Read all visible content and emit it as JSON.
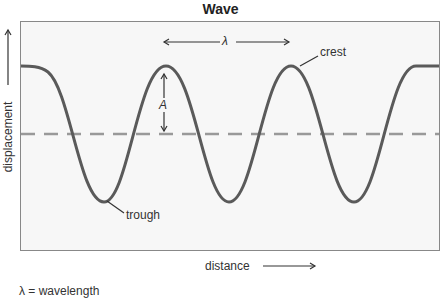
{
  "title": "Wave",
  "labels": {
    "wavelength_symbol": "λ",
    "amplitude_symbol": "A",
    "crest": "crest",
    "trough": "trough",
    "x_axis": "distance",
    "y_axis": "displacement"
  },
  "legend": "λ = wavelength",
  "colors": {
    "wave": "#5a5a5a",
    "midline": "#999999",
    "box_border": "#888888",
    "box_fill": "#f7f7f7"
  }
}
